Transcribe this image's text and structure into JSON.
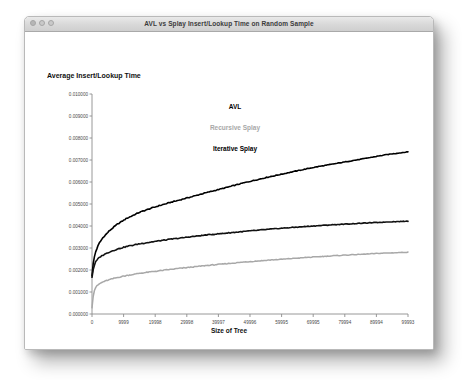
{
  "window": {
    "title": "AVL vs Splay Insert/Lookup Time on Random Sample",
    "controls": {
      "close": "close-button",
      "minimize": "minimize-button",
      "zoom": "zoom-button"
    }
  },
  "chart_data": {
    "type": "line",
    "title": "",
    "xlabel": "Size of Tree",
    "ylabel": "Average Insert/Lookup Time",
    "xlim": [
      0,
      99993
    ],
    "ylim": [
      0.0,
      0.01
    ],
    "grid": false,
    "legend_position": "inside-top-center",
    "xticks": [
      0,
      9999,
      19998,
      29998,
      39997,
      49996,
      59995,
      69995,
      79994,
      89994,
      99993
    ],
    "xticklabels": [
      "0",
      "9999",
      "19998",
      "29998",
      "39997",
      "49996",
      "59995",
      "69995",
      "79994",
      "89994",
      "99993"
    ],
    "yticks": [
      0.0,
      0.001,
      0.002,
      0.003,
      0.004,
      0.005,
      0.006,
      0.007,
      0.008,
      0.009,
      0.01
    ],
    "yticklabels": [
      "0.000000",
      "0.001000",
      "0.002000",
      "0.003000",
      "0.004000",
      "0.005000",
      "0.006000",
      "0.007000",
      "0.008000",
      "0.009000",
      "0.010000"
    ],
    "series": [
      {
        "name": "AVL",
        "color": "#000000",
        "x": [
          0,
          500,
          1200,
          2200,
          3500,
          5500,
          8000,
          11000,
          15000,
          20000,
          25000,
          30000,
          36000,
          42000,
          48000,
          55000,
          62000,
          70000,
          78000,
          86000,
          93000,
          99993
        ],
        "values": [
          0.00175,
          0.00245,
          0.00285,
          0.0032,
          0.00348,
          0.00378,
          0.00408,
          0.00435,
          0.00462,
          0.00487,
          0.00508,
          0.00527,
          0.00551,
          0.00573,
          0.00596,
          0.0062,
          0.00642,
          0.00666,
          0.00686,
          0.00706,
          0.00724,
          0.00737
        ]
      },
      {
        "name": "Recursive Splay",
        "color": "#a8a8a8",
        "x": [
          0,
          500,
          1200,
          2200,
          3500,
          5500,
          8000,
          11000,
          15000,
          20000,
          25000,
          30000,
          36000,
          42000,
          48000,
          55000,
          62000,
          70000,
          78000,
          86000,
          93000,
          99993
        ],
        "values": [
          0.0003,
          0.00098,
          0.00122,
          0.00136,
          0.00146,
          0.00156,
          0.00166,
          0.00175,
          0.00185,
          0.00194,
          0.00203,
          0.00211,
          0.0022,
          0.00228,
          0.00236,
          0.00244,
          0.00251,
          0.00259,
          0.00266,
          0.00272,
          0.00277,
          0.00281
        ]
      },
      {
        "name": "Iterative Splay",
        "color": "#111111",
        "x": [
          0,
          500,
          1200,
          2200,
          3500,
          5500,
          8000,
          11000,
          15000,
          20000,
          25000,
          30000,
          36000,
          42000,
          48000,
          55000,
          62000,
          70000,
          78000,
          86000,
          93000,
          99993
        ],
        "values": [
          0.00168,
          0.00212,
          0.00238,
          0.00256,
          0.00268,
          0.00282,
          0.00295,
          0.00307,
          0.00319,
          0.0033,
          0.0034,
          0.00349,
          0.00359,
          0.00367,
          0.00375,
          0.00384,
          0.00392,
          0.004,
          0.00407,
          0.00413,
          0.00418,
          0.00422
        ]
      }
    ],
    "legend_entries": [
      {
        "label": "AVL",
        "color": "#000000"
      },
      {
        "label": "Recursive Splay",
        "color": "#a8a8a8"
      },
      {
        "label": "Iterative Splay",
        "color": "#111111"
      }
    ]
  }
}
